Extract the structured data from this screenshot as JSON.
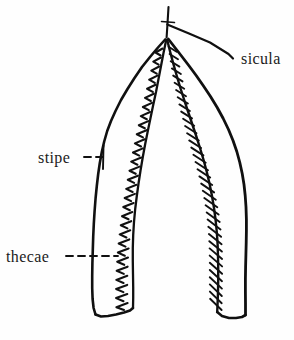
{
  "figure": {
    "kind": "scientific-line-drawing",
    "background_color": "#fefefe",
    "ink_color": "#101010",
    "labels": [
      {
        "id": "sicula",
        "text": "sicula",
        "leader": "solid-diagonal",
        "target": "apex / nema at top of the V"
      },
      {
        "id": "stipe",
        "text": "stipe",
        "leader": "dashed-with-end-tick",
        "target": "outer wall of left branch"
      },
      {
        "id": "thecae",
        "text": "thecae",
        "leader": "dashed-crossing",
        "target": "serrated inner margin of left branch"
      }
    ]
  }
}
